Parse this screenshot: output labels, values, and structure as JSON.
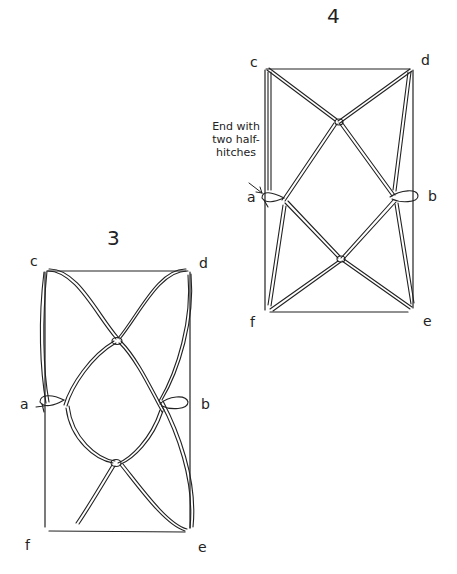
{
  "figure_3": {
    "number": "3",
    "labels": {
      "c": "c",
      "d": "d",
      "a": "a",
      "b": "b",
      "f": "f",
      "e": "e"
    }
  },
  "figure_4": {
    "number": "4",
    "labels": {
      "c": "c",
      "d": "d",
      "a": "a",
      "b": "b",
      "f": "f",
      "e": "e"
    },
    "annotation": {
      "line1": "End with",
      "line2": "two half-",
      "line3": "hitches"
    }
  }
}
